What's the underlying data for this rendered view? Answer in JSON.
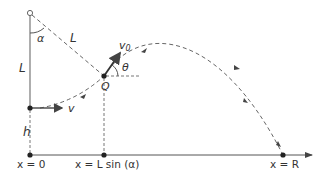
{
  "diagram": {
    "labels": {
      "alpha": "α",
      "L_rope": "L",
      "L_vertical": "L",
      "v0": "v",
      "v0_sub": "0",
      "theta": "θ",
      "Q": "Q",
      "v": "v",
      "h": "h",
      "x0": "x = 0",
      "xLsin": "x = L sin (α)",
      "xR": "x = R"
    },
    "colors": {
      "line": "#555555",
      "dash": "#666666",
      "text": "#333333",
      "point": "#222222"
    }
  }
}
